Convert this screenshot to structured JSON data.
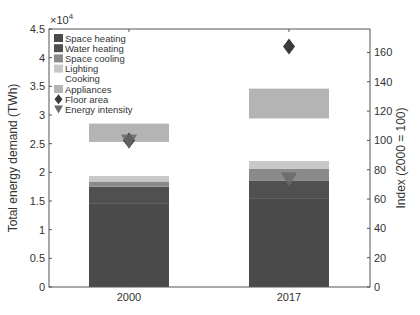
{
  "chart_data": {
    "type": "bar",
    "subtype": "stacked-bar-with-markers",
    "categories": [
      "2000",
      "2017"
    ],
    "left_axis": {
      "label": "Total energy demand (TWh)",
      "multiplier_label": "×10^4",
      "multiplier_base": "×10",
      "multiplier_exp": "4",
      "ylim": [
        0,
        4.5
      ],
      "ticks": [
        "0",
        "0.5",
        "1",
        "1.5",
        "2",
        "2.5",
        "3",
        "3.5",
        "4",
        "4.5"
      ]
    },
    "right_axis": {
      "label": "Index (2000 = 100)",
      "ylim": [
        0,
        176
      ],
      "ticks": [
        "0",
        "20",
        "40",
        "60",
        "80",
        "100",
        "120",
        "140",
        "160"
      ]
    },
    "series": [
      {
        "name": "Space heating",
        "color": "#4a4a4a",
        "values": [
          1.45,
          1.55
        ]
      },
      {
        "name": "Water heating",
        "color": "#505050",
        "values": [
          0.3,
          0.3
        ]
      },
      {
        "name": "Space cooling",
        "color": "#8a8a8a",
        "values": [
          0.09,
          0.21
        ]
      },
      {
        "name": "Lighting",
        "color": "#c8c8c8",
        "values": [
          0.1,
          0.14
        ]
      },
      {
        "name": "Cooking",
        "color": "#ffffff",
        "values": [
          0.59,
          0.74
        ]
      },
      {
        "name": "Appliances",
        "color": "#b4b4b4",
        "values": [
          0.32,
          0.52
        ]
      }
    ],
    "markers": [
      {
        "name": "Floor area",
        "shape": "diamond",
        "color": "#3a3a3a",
        "axis": "right",
        "values": [
          100,
          164
        ]
      },
      {
        "name": "Energy intensity",
        "shape": "triangle-down",
        "color": "#6a6a6a",
        "axis": "right",
        "values": [
          100,
          74
        ]
      }
    ],
    "units": "×10^4 TWh",
    "legend_position": "upper-left",
    "grid": false
  }
}
